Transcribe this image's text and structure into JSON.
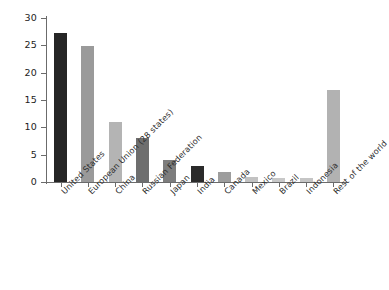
{
  "chart_data": {
    "type": "bar",
    "title": "",
    "subtitle": "",
    "xlabel": "",
    "ylabel": "",
    "ylim": [
      0,
      30
    ],
    "ytick_values": [
      0,
      5,
      10,
      15,
      20,
      25,
      30
    ],
    "ytick_labels": [
      "0",
      "5",
      "10",
      "15",
      "20",
      "25",
      "30"
    ],
    "grid": false,
    "legend": false,
    "legend_position": "none",
    "categories": [
      "United States",
      "European Union (28 states)",
      "China",
      "Russian Federation",
      "Japan",
      "India",
      "Canada",
      "Mexico",
      "Brazil",
      "Indonesia",
      "Rest of the world"
    ],
    "values": [
      27.2,
      24.9,
      11.0,
      8.0,
      4.0,
      3.0,
      1.8,
      0.9,
      0.8,
      0.8,
      16.8
    ],
    "bar_colors": [
      "#262626",
      "#9a9a9a",
      "#b4b4b4",
      "#6e6e6e",
      "#7d7d7d",
      "#2b2b2b",
      "#9d9d9d",
      "#c2c2c2",
      "#c8c8c8",
      "#c5c5c5",
      "#b2b2b2"
    ],
    "axis_color": "#6b6b6b",
    "background_color": "#ffffff"
  }
}
